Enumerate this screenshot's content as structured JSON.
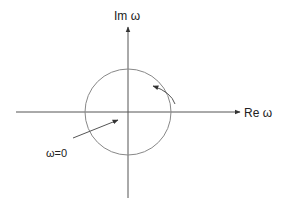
{
  "diagram": {
    "axes": {
      "x_label": "Re ω",
      "y_label": "Im ω"
    },
    "annotations": {
      "origin_label": "ω=0",
      "rotation_direction": "counterclockwise"
    },
    "colors": {
      "axis": "#444444",
      "circle": "#888888",
      "text": "#222222"
    }
  }
}
